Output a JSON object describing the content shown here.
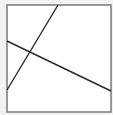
{
  "diagram": {
    "canvas": {
      "width": 113,
      "height": 115,
      "background": "#f2f2f2"
    },
    "frame": {
      "x": 7,
      "y": 5,
      "width": 104,
      "height": 107,
      "fill": "#ffffff",
      "stroke": "#7a7a7a",
      "stroke_width": 1.5
    },
    "lines": [
      {
        "id": "steep-line",
        "x1": 58,
        "y1": 5,
        "x2": 7,
        "y2": 90,
        "stroke": "#2a2a2a",
        "stroke_width": 1.4
      },
      {
        "id": "shallow-line",
        "x1": 7,
        "y1": 41,
        "x2": 111,
        "y2": 91,
        "stroke": "#2a2a2a",
        "stroke_width": 1.4
      }
    ],
    "intersection": {
      "x": 31,
      "y": 52
    }
  }
}
